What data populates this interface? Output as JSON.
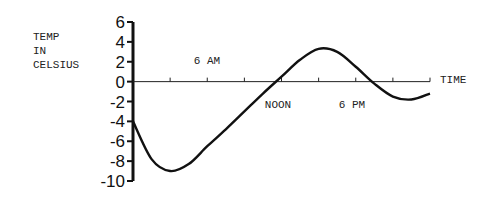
{
  "chart_data": {
    "type": "line",
    "title": "",
    "xlabel": "TIME",
    "ylabel": "TEMP IN CELSIUS",
    "ylabel_lines": [
      "TEMP",
      "IN",
      "CELSIUS"
    ],
    "ylim": [
      -10,
      6
    ],
    "yticks": [
      6,
      4,
      2,
      0,
      -2,
      -4,
      -6,
      -8,
      -10
    ],
    "xlim_hours": [
      0,
      24
    ],
    "xtick_hours": [
      3,
      6,
      9,
      12,
      15,
      18,
      21,
      24
    ],
    "x_annotations": [
      {
        "label": "6 AM",
        "hour": 6
      },
      {
        "label": "NOON",
        "hour": 12
      },
      {
        "label": "6 PM",
        "hour": 18
      }
    ],
    "grid": false,
    "legend": null,
    "series": [
      {
        "name": "Temperature",
        "x": [
          0,
          1.5,
          3,
          4.5,
          6,
          7.5,
          9,
          10.5,
          12,
          13.5,
          15,
          16.5,
          18,
          19.5,
          21,
          22.5,
          24
        ],
        "values": [
          -4,
          -7.8,
          -9,
          -8.3,
          -6.5,
          -4.8,
          -3,
          -1.2,
          0.5,
          2.2,
          3.3,
          3,
          1.5,
          -0.2,
          -1.5,
          -1.8,
          -1.2
        ]
      }
    ]
  }
}
